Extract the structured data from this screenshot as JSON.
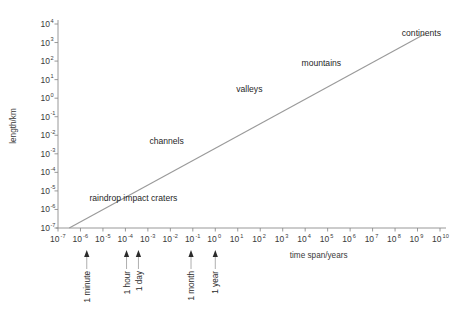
{
  "chart_data": {
    "type": "line",
    "title": "",
    "xlabel": "time span/years",
    "ylabel": "length/km",
    "xlim": [
      -7,
      10
    ],
    "ylim": [
      -7,
      4
    ],
    "xscale": "log",
    "yscale": "log",
    "grid": false,
    "legend": null,
    "x_tick_labels": [
      "10-7",
      "10-6",
      "10-5",
      "10-4",
      "10-3",
      "10-2",
      "10-1",
      "100",
      "101",
      "102",
      "103",
      "104",
      "105",
      "106",
      "107",
      "108",
      "109",
      "1010"
    ],
    "x_tick_exponents": [
      "-7",
      "-6",
      "-5",
      "-4",
      "-3",
      "-2",
      "-1",
      "0",
      "1",
      "2",
      "3",
      "4",
      "5",
      "6",
      "7",
      "8",
      "9",
      "10"
    ],
    "y_tick_exponents": [
      "4",
      "3",
      "2",
      "1",
      "0",
      "-1",
      "-2",
      "-3",
      "-4",
      "-5",
      "-6",
      "-7"
    ],
    "mantissa": "10",
    "series": [
      {
        "name": "landform scaling relation",
        "x": [
          -6.5,
          9.3
        ],
        "y": [
          -7.0,
          3.45
        ],
        "comment": "straight line on log-log axes, slope about 0.66 decades of length per decade of time"
      }
    ],
    "annotations": [
      {
        "label": "raindrop impact craters",
        "x": -5.6,
        "y": -5.55
      },
      {
        "label": "channels",
        "x": -1.4,
        "y": -2.45
      },
      {
        "label": "valleys",
        "x": 2.1,
        "y": 0.35
      },
      {
        "label": "mountains",
        "x": 5.6,
        "y": 1.75
      },
      {
        "label": "continents",
        "x": 8.3,
        "y": 3.35
      }
    ],
    "time_markers": [
      {
        "label": "1 minute",
        "x": -5.72
      },
      {
        "label": "1 hour",
        "x": -3.95
      },
      {
        "label": "1 day",
        "x": -3.42
      },
      {
        "label": "1 month",
        "x": -1.08
      },
      {
        "label": "1 year",
        "x": 0.0
      }
    ],
    "colors": {
      "line": "#9a9a9a",
      "axis": "#8d8d8d",
      "text": "#2b2b2b",
      "background": "#ffffff"
    }
  }
}
